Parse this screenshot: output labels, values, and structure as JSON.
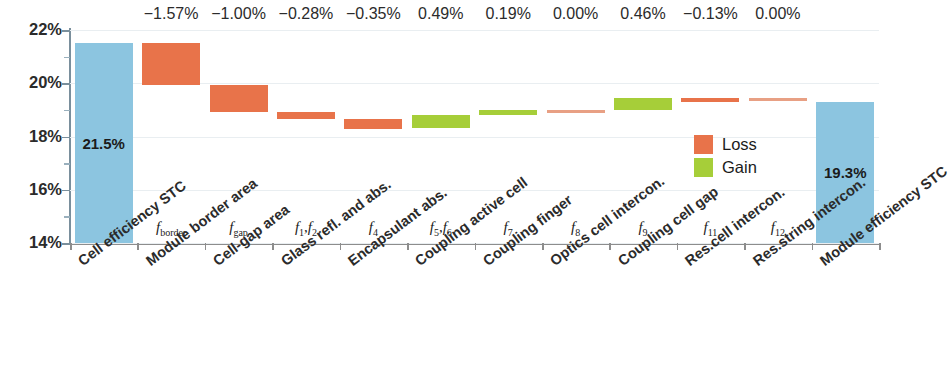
{
  "chart_data": {
    "type": "bar",
    "subtype": "waterfall",
    "title": "",
    "xlabel": "",
    "ylabel": "",
    "ylim": [
      14,
      22
    ],
    "yticks": [
      "14%",
      "16%",
      "18%",
      "20%",
      "22%"
    ],
    "ytick_values": [
      14,
      16,
      18,
      20,
      22
    ],
    "grid": true,
    "legend_position": "inside-right",
    "legend": [
      {
        "label": "Loss",
        "color": "#e8734a"
      },
      {
        "label": "Gain",
        "color": "#a6ce39"
      }
    ],
    "categories": [
      "Cell efficiency STC",
      "Module border area",
      "Cell-gap area",
      "Glass refl. and abs.",
      "Encapsulant abs.",
      "Coupling active cell",
      "Coupling finger",
      "Optics cell intercon.",
      "Coupling cell gap",
      "Res.cell intercon.",
      "Res.string intercon.",
      "Module efficiency STC"
    ],
    "symbols": [
      "",
      "f_border",
      "f_gap",
      "f_1,f_2",
      "f_4",
      "f_5,f_6",
      "f_7",
      "f_8",
      "f_9",
      "f_11",
      "f_12",
      ""
    ],
    "delta_labels": [
      "",
      "−1.57%",
      "−1.00%",
      "−0.28%",
      "−0.35%",
      "0.49%",
      "0.19%",
      "0.00%",
      "0.46%",
      "−0.13%",
      "0.00%",
      ""
    ],
    "values": [
      21.5,
      -1.57,
      -1.0,
      -0.28,
      -0.35,
      0.49,
      0.19,
      0.0,
      0.46,
      -0.13,
      0.0,
      19.3
    ],
    "bar_kinds": [
      "total",
      "loss",
      "loss",
      "loss",
      "loss",
      "gain",
      "gain",
      "zero",
      "gain",
      "loss",
      "zero",
      "total"
    ],
    "cumulative_start": [
      14.0,
      19.93,
      18.93,
      18.65,
      18.3,
      18.3,
      18.79,
      18.98,
      18.98,
      19.31,
      19.44,
      14.0
    ],
    "cumulative_end": [
      21.5,
      21.5,
      19.93,
      18.93,
      18.65,
      18.79,
      18.98,
      18.98,
      19.44,
      19.44,
      19.44,
      19.3
    ],
    "bar_labels_inside": [
      {
        "index": 0,
        "text": "21.5%"
      },
      {
        "index": 11,
        "text": "19.3%"
      }
    ],
    "colors": {
      "total": "#8cc5e0",
      "loss": "#e8734a",
      "gain": "#a6ce39",
      "zero": "#e8a084",
      "axis": "#8d8d8d",
      "grid": "#e9eef1",
      "text": "#2b2b2b"
    }
  }
}
